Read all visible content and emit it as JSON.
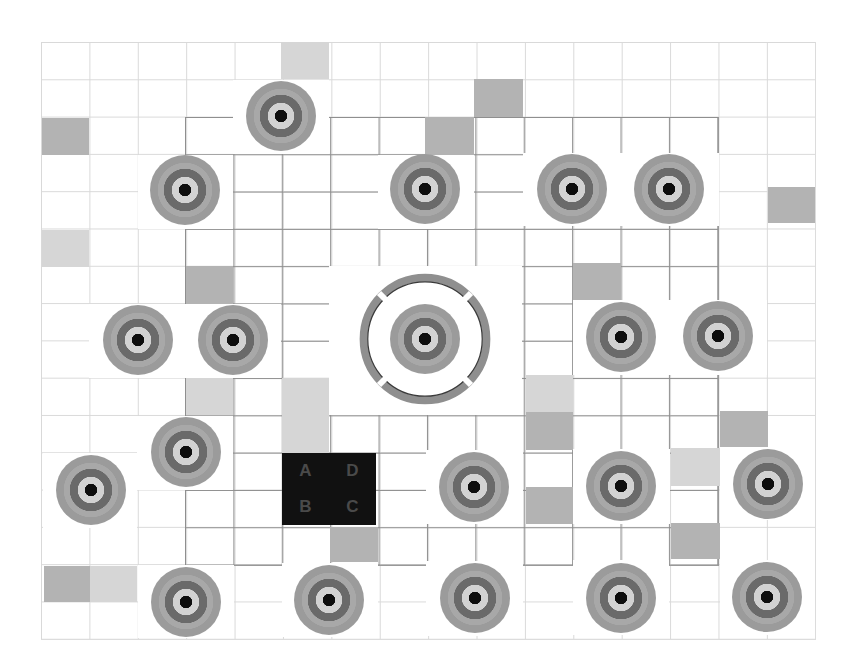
{
  "board": {
    "grid": {
      "columns": 16,
      "rows": 16,
      "origin": [
        41,
        42
      ],
      "cell_width": 48.4,
      "cell_height": 37.3
    },
    "colors": {
      "background": "#ffffff",
      "outer_grid_line": "#d9d9d9",
      "inner_grid_line": "#8e8e8e",
      "shade_gray": "#b3b3b3",
      "shade_light": "#d6d6d6",
      "target_outer": "#9b9b9b",
      "target_band": "#a8a8a8",
      "target_dark_ring": "#6a6a6a",
      "target_light_ring": "#d2d2d2",
      "target_center": "#0e0e0e",
      "reticle_ring": "#8f8f8f",
      "label_box": "#111111",
      "label_text": "#4a4a4a"
    },
    "shaded_cells": [
      {
        "x": 281,
        "y": 42,
        "w": 48,
        "h": 37,
        "tone": "light"
      },
      {
        "x": 474,
        "y": 79,
        "w": 49,
        "h": 38,
        "tone": "gray"
      },
      {
        "x": 42,
        "y": 118,
        "w": 47,
        "h": 37,
        "tone": "gray"
      },
      {
        "x": 425,
        "y": 117,
        "w": 49,
        "h": 38,
        "tone": "gray"
      },
      {
        "x": 768,
        "y": 187,
        "w": 47,
        "h": 36,
        "tone": "gray"
      },
      {
        "x": 42,
        "y": 230,
        "w": 47,
        "h": 37,
        "tone": "light"
      },
      {
        "x": 186,
        "y": 266,
        "w": 47,
        "h": 37,
        "tone": "gray"
      },
      {
        "x": 573,
        "y": 263,
        "w": 48,
        "h": 37,
        "tone": "gray"
      },
      {
        "x": 186,
        "y": 378,
        "w": 47,
        "h": 37,
        "tone": "light"
      },
      {
        "x": 282,
        "y": 378,
        "w": 47,
        "h": 37,
        "tone": "light"
      },
      {
        "x": 282,
        "y": 415,
        "w": 47,
        "h": 38,
        "tone": "light"
      },
      {
        "x": 526,
        "y": 375,
        "w": 47,
        "h": 37,
        "tone": "light"
      },
      {
        "x": 526,
        "y": 412,
        "w": 47,
        "h": 38,
        "tone": "gray"
      },
      {
        "x": 720,
        "y": 411,
        "w": 48,
        "h": 36,
        "tone": "gray"
      },
      {
        "x": 671,
        "y": 448,
        "w": 49,
        "h": 38,
        "tone": "light"
      },
      {
        "x": 526,
        "y": 487,
        "w": 47,
        "h": 37,
        "tone": "gray"
      },
      {
        "x": 330,
        "y": 527,
        "w": 48,
        "h": 35,
        "tone": "gray"
      },
      {
        "x": 671,
        "y": 523,
        "w": 49,
        "h": 36,
        "tone": "gray"
      },
      {
        "x": 44,
        "y": 566,
        "w": 46,
        "h": 36,
        "tone": "gray"
      },
      {
        "x": 90,
        "y": 566,
        "w": 47,
        "h": 36,
        "tone": "light"
      }
    ],
    "clearings": [
      {
        "x": 233,
        "y": 80,
        "w": 96,
        "h": 74
      },
      {
        "x": 138,
        "y": 155,
        "w": 95,
        "h": 74
      },
      {
        "x": 378,
        "y": 155,
        "w": 96,
        "h": 74
      },
      {
        "x": 523,
        "y": 153,
        "w": 196,
        "h": 73
      },
      {
        "x": 89,
        "y": 304,
        "w": 192,
        "h": 74
      },
      {
        "x": 329,
        "y": 266,
        "w": 193,
        "h": 149
      },
      {
        "x": 573,
        "y": 300,
        "w": 194,
        "h": 75
      },
      {
        "x": 137,
        "y": 416,
        "w": 96,
        "h": 74
      },
      {
        "x": 43,
        "y": 453,
        "w": 94,
        "h": 75
      },
      {
        "x": 426,
        "y": 450,
        "w": 97,
        "h": 74
      },
      {
        "x": 573,
        "y": 449,
        "w": 97,
        "h": 75
      },
      {
        "x": 720,
        "y": 447,
        "w": 95,
        "h": 73
      },
      {
        "x": 138,
        "y": 565,
        "w": 96,
        "h": 73
      },
      {
        "x": 282,
        "y": 563,
        "w": 96,
        "h": 74
      },
      {
        "x": 426,
        "y": 561,
        "w": 97,
        "h": 75
      },
      {
        "x": 573,
        "y": 560,
        "w": 96,
        "h": 75
      },
      {
        "x": 720,
        "y": 560,
        "w": 95,
        "h": 75
      }
    ],
    "targets": [
      {
        "x": 281,
        "y": 116
      },
      {
        "x": 185,
        "y": 190
      },
      {
        "x": 425,
        "y": 189
      },
      {
        "x": 572,
        "y": 189
      },
      {
        "x": 669,
        "y": 189
      },
      {
        "x": 138,
        "y": 340
      },
      {
        "x": 233,
        "y": 340
      },
      {
        "x": 425,
        "y": 339
      },
      {
        "x": 621,
        "y": 337
      },
      {
        "x": 718,
        "y": 336
      },
      {
        "x": 186,
        "y": 452
      },
      {
        "x": 91,
        "y": 490
      },
      {
        "x": 474,
        "y": 487
      },
      {
        "x": 621,
        "y": 486
      },
      {
        "x": 768,
        "y": 484
      },
      {
        "x": 186,
        "y": 602
      },
      {
        "x": 329,
        "y": 600
      },
      {
        "x": 475,
        "y": 598
      },
      {
        "x": 621,
        "y": 598
      },
      {
        "x": 767,
        "y": 597
      }
    ],
    "reticle": {
      "center": [
        425,
        339
      ],
      "radius": 68,
      "segments": 4
    },
    "label_box": {
      "labels": {
        "top_left": "A",
        "top_right": "D",
        "bottom_left": "B",
        "bottom_right": "C"
      }
    }
  }
}
